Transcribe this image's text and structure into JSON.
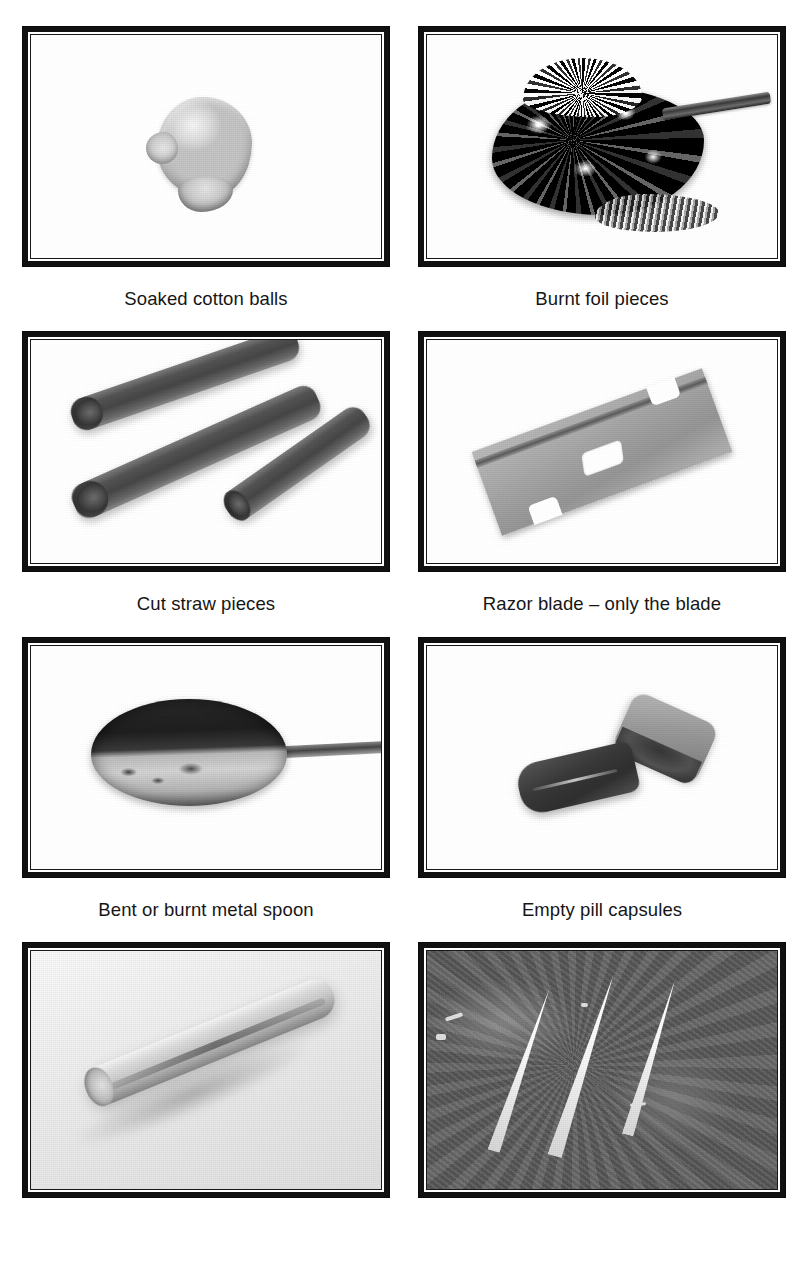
{
  "page": {
    "background_color": "#ffffff",
    "layout": "2-column x 4-row photo grid with captions",
    "columns": 2,
    "rows": 4
  },
  "items": [
    {
      "position": "row1-left",
      "caption": "Soaked cotton balls",
      "photo_name": "soaked-cotton-balls-photo",
      "photo_description": "Light gray irregular cotton wad on white background"
    },
    {
      "position": "row1-right",
      "caption": "Burnt foil pieces",
      "photo_name": "burnt-foil-pieces-photo",
      "photo_description": "Crumpled blackened aluminum foil with a metal rod at upper right"
    },
    {
      "position": "row2-left",
      "caption": "Cut straw pieces",
      "photo_name": "cut-straw-pieces-photo",
      "photo_description": "Three dark diagonal cut drinking straw segments on white"
    },
    {
      "position": "row2-right",
      "caption": "Razor blade – only the blade",
      "photo_name": "razor-blade-photo",
      "photo_description": "Single gray razor blade angled diagonally with center slot and side notches"
    },
    {
      "position": "row3-left",
      "caption": "Bent or burnt metal spoon",
      "photo_name": "burnt-metal-spoon-photo",
      "photo_description": "Spoon bowl with blackened burnt upper surface and handle extending right"
    },
    {
      "position": "row3-right",
      "caption": "Empty pill capsules",
      "photo_name": "empty-pill-capsules-photo",
      "photo_description": "Two separated capsule halves, dark body and lighter cap"
    },
    {
      "position": "row4-left",
      "caption": "",
      "photo_name": "rolled-tube-photo",
      "photo_description": "Tightly rolled paper tube lying diagonally on a pale surface"
    },
    {
      "position": "row4-right",
      "caption": "",
      "photo_name": "powder-lines-photo",
      "photo_description": "Three white diagonal powder lines on a dark mottled surface"
    }
  ],
  "colors": {
    "frame_outer": "#111111",
    "frame_gap": "#ffffff",
    "photo_border": "#1d1d1d",
    "caption_text": "#161616",
    "page_background": "#ffffff"
  }
}
